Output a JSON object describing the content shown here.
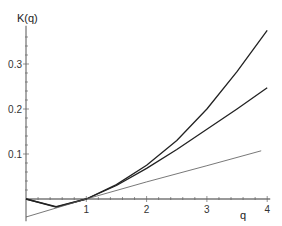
{
  "chart_data": {
    "type": "line",
    "title": "",
    "xlabel": "q",
    "ylabel": "K(q)",
    "xlim": [
      0,
      4.05
    ],
    "ylim": [
      -0.045,
      0.385
    ],
    "x_ticks": [
      1,
      2,
      3,
      4
    ],
    "x_tick_labels": [
      "1",
      "2",
      "3",
      "4"
    ],
    "y_ticks": [
      0.1,
      0.2,
      0.3
    ],
    "y_tick_labels": [
      "0.1",
      "0.2",
      "0.3"
    ],
    "grid": false,
    "legend": null,
    "series": [
      {
        "name": "upper curve",
        "style": "thick",
        "x": [
          0,
          0.5,
          1,
          1.5,
          2,
          2.5,
          3,
          3.5,
          4
        ],
        "y": [
          0,
          -0.018,
          0,
          0.032,
          0.075,
          0.13,
          0.2,
          0.283,
          0.375
        ]
      },
      {
        "name": "middle curve",
        "style": "thick",
        "x": [
          0,
          0.5,
          1,
          1.5,
          2,
          2.5,
          3,
          3.5,
          4
        ],
        "y": [
          0,
          -0.017,
          0,
          0.03,
          0.068,
          0.11,
          0.155,
          0.2,
          0.247
        ]
      },
      {
        "name": "linear tangent",
        "style": "thin",
        "x": [
          0,
          1,
          2,
          3,
          3.9
        ],
        "y": [
          -0.04,
          0.0,
          0.038,
          0.074,
          0.107
        ]
      }
    ]
  },
  "axes": {
    "y_title": "K(q)",
    "x_title": "q"
  }
}
